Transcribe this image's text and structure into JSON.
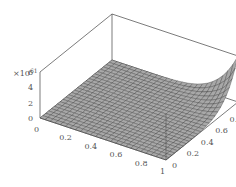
{
  "chart_data": {
    "type": "surface",
    "title": "",
    "xlabel": "",
    "ylabel": "",
    "zlabel": "",
    "z_multiplier_label": "×10",
    "z_exponent": "61",
    "x_ticks": [
      "0",
      "0.2",
      "0.4",
      "0.6",
      "0.8",
      "1"
    ],
    "y_ticks": [
      "0",
      "0.2",
      "0.4",
      "0.6",
      "0.8",
      "1"
    ],
    "z_ticks": [
      "0",
      "2",
      "4",
      "6"
    ],
    "xlim": [
      0,
      1
    ],
    "ylim": [
      0,
      1
    ],
    "zlim": [
      0,
      6
    ],
    "grid_resolution": 25,
    "surface_description": "Nearly flat at z≈0 across most of the domain, rising steeply toward the corner x=1, y=1 where z reaches about 6×10^61",
    "corner_values": {
      "x0_y0": 0,
      "x1_y0": 0,
      "x0_y1": 0,
      "x1_y1": 6
    },
    "colors": {
      "surface": "#a8a8a8",
      "mesh": "#333333",
      "box": "#444444"
    }
  }
}
